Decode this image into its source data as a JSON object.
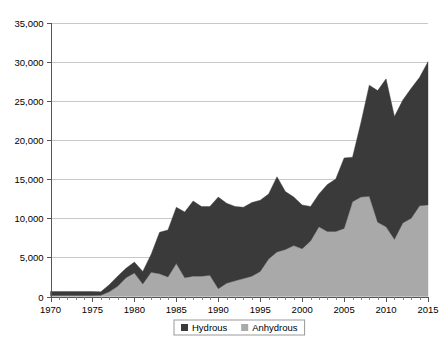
{
  "chart_data": {
    "type": "area",
    "stacked": true,
    "title": "",
    "subtitle": "",
    "xlabel": "",
    "ylabel": "",
    "xlim": [
      1970,
      2015
    ],
    "ylim": [
      0,
      35000
    ],
    "grid": true,
    "legend_position": "bottom",
    "x_tick_labels": [
      "1970",
      "1975",
      "1980",
      "1985",
      "1990",
      "1995",
      "2000",
      "2005",
      "2010",
      "2015"
    ],
    "x_tick_values": [
      1970,
      1975,
      1980,
      1985,
      1990,
      1995,
      2000,
      2005,
      2010,
      2015
    ],
    "x_minor_tick_interval": 1,
    "y_tick_labels": [
      "0",
      "5,000",
      "10,000",
      "15,000",
      "20,000",
      "25,000",
      "30,000",
      "35,000"
    ],
    "y_tick_values": [
      0,
      5000,
      10000,
      15000,
      20000,
      25000,
      30000,
      35000
    ],
    "x": [
      1970,
      1971,
      1972,
      1973,
      1974,
      1975,
      1976,
      1977,
      1978,
      1979,
      1980,
      1981,
      1982,
      1983,
      1984,
      1985,
      1986,
      1987,
      1988,
      1989,
      1990,
      1991,
      1992,
      1993,
      1994,
      1995,
      1996,
      1997,
      1998,
      1999,
      2000,
      2001,
      2002,
      2003,
      2004,
      2005,
      2006,
      2007,
      2008,
      2009,
      2010,
      2011,
      2012,
      2013,
      2014,
      2015
    ],
    "series": [
      {
        "name": "Anhydrous",
        "color": "#a9a9a9",
        "values": [
          120,
          120,
          120,
          120,
          120,
          120,
          150,
          600,
          1300,
          2400,
          3000,
          1600,
          3100,
          2900,
          2500,
          4200,
          2400,
          2600,
          2600,
          2700,
          1000,
          1700,
          2000,
          2300,
          2600,
          3200,
          4800,
          5700,
          6000,
          6500,
          6100,
          7100,
          8900,
          8300,
          8300,
          8700,
          12100,
          12700,
          12800,
          9500,
          8900,
          7300,
          9400,
          10000,
          11600,
          11700
        ]
      },
      {
        "name": "Hydrous",
        "color": "#3a3a3a",
        "values": [
          520,
          520,
          520,
          520,
          520,
          520,
          450,
          900,
          1300,
          1200,
          1400,
          1600,
          2300,
          5300,
          6000,
          7200,
          8400,
          9600,
          8900,
          8800,
          11700,
          10200,
          9500,
          9100,
          9400,
          9100,
          8300,
          9600,
          7400,
          6200,
          5600,
          4400,
          4200,
          6000,
          6700,
          9000,
          5700,
          9500,
          14200,
          16800,
          18900,
          15700,
          15700,
          16600,
          16400,
          18300
        ]
      }
    ],
    "totals": [
      640,
      640,
      640,
      640,
      640,
      640,
      600,
      1500,
      2600,
      3600,
      4400,
      3200,
      5400,
      8200,
      8500,
      11400,
      10800,
      12200,
      11500,
      11500,
      12700,
      11900,
      11500,
      11400,
      12000,
      12300,
      13100,
      15300,
      13400,
      12700,
      11700,
      11500,
      13100,
      14300,
      15000,
      17700,
      17800,
      22200,
      27000,
      26300,
      27800,
      23000,
      25100,
      26600,
      28000,
      30000
    ],
    "legend": [
      {
        "label": "Hydrous",
        "color": "#3a3a3a"
      },
      {
        "label": "Anhydrous",
        "color": "#a9a9a9"
      }
    ]
  },
  "colors": {
    "hydrous": "#3a3a3a",
    "anhydrous": "#a9a9a9",
    "grid": "#c8c8c8",
    "axis": "#555555",
    "background": "#ffffff",
    "text": "#000000"
  }
}
